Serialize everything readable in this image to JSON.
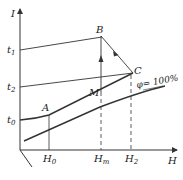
{
  "diagram": {
    "axes": {
      "y_label": "I",
      "x_label": "H"
    },
    "y_ticks": [
      {
        "name": "t",
        "sub": "1"
      },
      {
        "name": "t",
        "sub": "2"
      },
      {
        "name": "t",
        "sub": "0"
      }
    ],
    "x_ticks": [
      {
        "name": "H",
        "sub": "0"
      },
      {
        "name": "H",
        "sub": "m"
      },
      {
        "name": "H",
        "sub": "2"
      }
    ],
    "points": {
      "A": "A",
      "B": "B",
      "C": "C",
      "M": "M"
    },
    "curve_label": "φ= 100%"
  }
}
